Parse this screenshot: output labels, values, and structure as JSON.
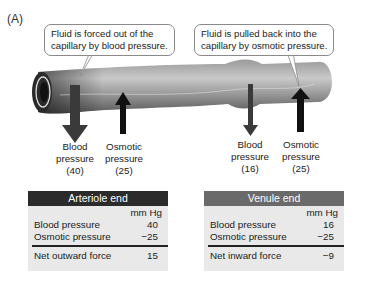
{
  "panel_label": "(A)",
  "callouts": {
    "left": [
      "Fluid is forced out of the",
      "capillary by blood pressure."
    ],
    "right": [
      "Fluid is pulled back into the",
      "capillary by osmotic pressure."
    ]
  },
  "arrows": {
    "arteriole_blood": [
      "Blood",
      "pressure",
      "(40)"
    ],
    "arteriole_osmotic": [
      "Osmotic",
      "pressure",
      "(25)"
    ],
    "venule_blood": [
      "Blood",
      "pressure",
      "(16)"
    ],
    "venule_osmotic": [
      "Osmotic",
      "pressure",
      "(25)"
    ]
  },
  "tables": {
    "arteriole": {
      "title": "Arteriole end",
      "units": "mm Hg",
      "rows": [
        {
          "label": "Blood pressure",
          "value": "40"
        },
        {
          "label": "Osmotic pressure",
          "value": "−25"
        }
      ],
      "net": {
        "label": "Net outward force",
        "value": "15"
      },
      "header_color": "#2b2b2b"
    },
    "venule": {
      "title": "Venule end",
      "units": "mm Hg",
      "rows": [
        {
          "label": "Blood pressure",
          "value": "16"
        },
        {
          "label": "Osmotic pressure",
          "value": "−25"
        }
      ],
      "net": {
        "label": "Net inward force",
        "value": "−9"
      },
      "header_color": "#6a6a6a"
    }
  }
}
